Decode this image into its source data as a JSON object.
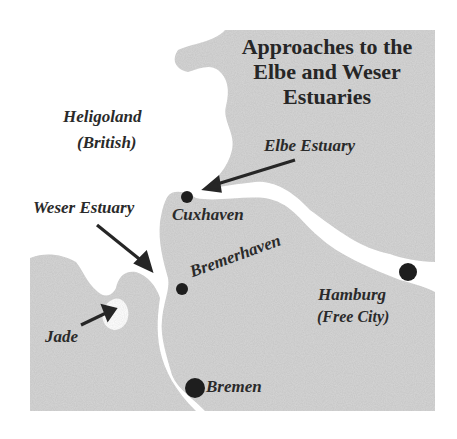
{
  "map": {
    "title_lines": [
      "Approaches to the",
      "Elbe and Weser",
      "Estuaries"
    ],
    "colors": {
      "land": "#d4d4d4",
      "water": "#ffffff",
      "ink": "#262626",
      "city_dot": "#1e1e1e"
    },
    "labels": {
      "heligoland": "Heligoland",
      "heligoland_note": "(British)",
      "elbe_estuary": "Elbe Estuary",
      "weser_estuary": "Weser Estuary",
      "cuxhaven": "Cuxhaven",
      "bremerhaven": "Bremerhaven",
      "hamburg": "Hamburg",
      "hamburg_note": "(Free City)",
      "jade": "Jade",
      "bremen": "Bremen"
    },
    "cities": [
      {
        "name": "Cuxhaven",
        "x": 187,
        "y": 197,
        "r": 6
      },
      {
        "name": "Bremerhaven",
        "x": 182,
        "y": 289,
        "r": 6
      },
      {
        "name": "Hamburg",
        "x": 408,
        "y": 272,
        "r": 9
      },
      {
        "name": "Bremen",
        "x": 195,
        "y": 388,
        "r": 10
      }
    ],
    "arrows": [
      {
        "name": "elbe-arrow",
        "from": [
          295,
          160
        ],
        "to": [
          207,
          188
        ]
      },
      {
        "name": "weser-arrow",
        "from": [
          97,
          225
        ],
        "to": [
          150,
          268
        ]
      },
      {
        "name": "jade-arrow",
        "from": [
          81,
          325
        ],
        "to": [
          113,
          311
        ]
      }
    ]
  }
}
